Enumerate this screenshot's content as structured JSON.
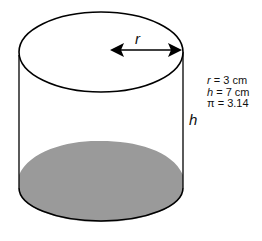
{
  "diagram": {
    "labels": {
      "radius": "r",
      "height": "h"
    },
    "given": [
      {
        "var": "r",
        "rest": " = 3 cm"
      },
      {
        "var": "h",
        "rest": " = 7 cm"
      },
      {
        "var": "",
        "rest": "π = 3.14"
      }
    ],
    "colors": {
      "stroke": "#000000",
      "base_fill": "#9a9a9a",
      "background": "#ffffff"
    }
  }
}
